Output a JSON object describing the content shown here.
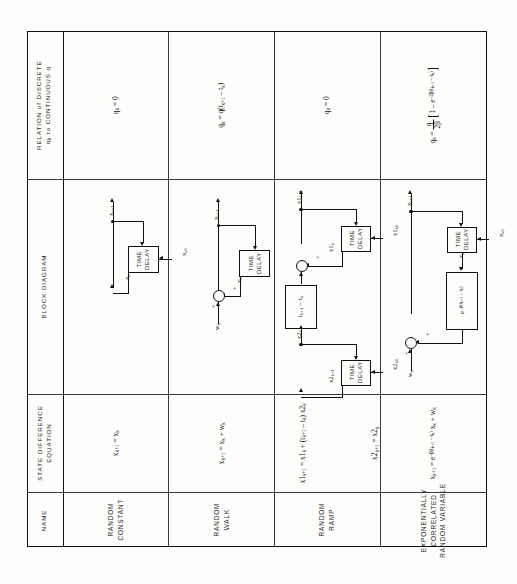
{
  "table": {
    "row_headers": [
      {
        "id": "relation",
        "line1": "RELATION of DISCRETE",
        "line2": "q_k to CONTINUOUS q"
      },
      {
        "id": "block-diagram",
        "label": "BLOCK  DIAGRAM"
      },
      {
        "id": "state-difference-equation",
        "line1": "STATE DIFFERENCE",
        "line2": "EQUATION"
      },
      {
        "id": "name",
        "label": "NAME"
      }
    ],
    "models": [
      {
        "name_lines": [
          "RANDOM",
          "CONSTANT"
        ],
        "state_equations": [
          "x_{k+1} = x_k"
        ],
        "relation": "q_k = 0",
        "diagram": {
          "type": "single-delay-feedback",
          "output_label": "x_{k+1}",
          "delay_block": "TIME DELAY",
          "delay_input_label": "x_k",
          "init_label": "x_{k0}"
        }
      },
      {
        "name_lines": [
          "RANDOM",
          "WALK"
        ],
        "state_equations": [
          "x_{k+1} = x_k + w_k"
        ],
        "relation": "q_k = q(t_{k+1} - t_k)",
        "diagram": {
          "type": "summer-delay-feedback",
          "output_label": "x_{k+1}",
          "input_label": "w_k",
          "delay_block": "TIME DELAY",
          "delay_output_label": "x_k",
          "signs": [
            "+",
            "+"
          ]
        }
      },
      {
        "name_lines": [
          "RANDOM",
          "RAMP"
        ],
        "state_equations": [
          "x1_{k+1} = x1_k + (t_{k+1} - t_k) x2_k",
          "x2_{k+1} = x2_k"
        ],
        "relation": "q_k = 0",
        "diagram": {
          "type": "two-state-ramp",
          "output_label": "x1_{k+1}",
          "gain_block": "t_{k+1} - t_k",
          "upper_delay_block": "TIME DELAY",
          "upper_delay_init": "x1_{k0}",
          "upper_feedback_label": "x1_k",
          "mid_label": "x2_k",
          "lower_delay_block": "TIME DELAY",
          "lower_delay_init": "x2_{k0}",
          "lower_feedback_label": "x2_{k+1}",
          "signs": [
            "+",
            "+"
          ]
        }
      },
      {
        "name_lines": [
          "EXPONENTIALLY",
          "CORRELATED",
          "RANDOM VARIABLE"
        ],
        "state_equations": [
          "x_{k+1} = e^{-β(t_{k+1}-t_k)} x_k + w_k"
        ],
        "relation": "q_k = (q / 2β) [ 1 - e^{-2β(t_{k+1}-t_k)} ]",
        "diagram": {
          "type": "gain-delay-feedback",
          "output_label": "x_{k+1}",
          "input_label": "w_k",
          "gain_block": "e^{-β(t_{k+1}-t_k)}",
          "delay_block": "TIME DELAY",
          "delay_init": "x_{k0}",
          "delay_output_label": "x_k",
          "signs": [
            "+",
            "+"
          ]
        }
      }
    ]
  },
  "colors": {
    "ink": "#111111",
    "paper": "#fdfdfb",
    "rule": "#3a3a3a"
  }
}
